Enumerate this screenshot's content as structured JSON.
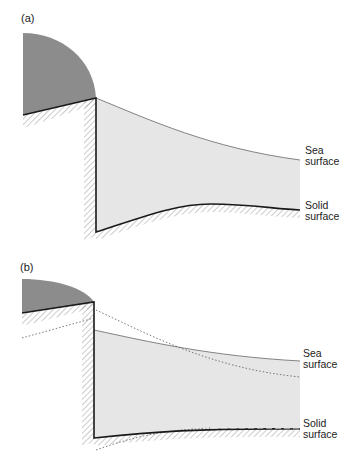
{
  "panels": [
    {
      "id": "a",
      "label": "(a)",
      "annotations": {
        "sea_surface": {
          "line1": "Sea",
          "line2": "surface"
        },
        "solid_surface": {
          "line1": "Solid",
          "line2": "surface"
        }
      }
    },
    {
      "id": "b",
      "label": "(b)",
      "annotations": {
        "sea_surface": {
          "line1": "Sea",
          "line2": "surface"
        },
        "solid_surface": {
          "line1": "Solid",
          "line2": "surface"
        }
      }
    }
  ],
  "colors": {
    "ice": "#8c8c8c",
    "water": "#e6e6e6",
    "outline": "#1a1a1a",
    "hatch": "#9a9a9a"
  }
}
